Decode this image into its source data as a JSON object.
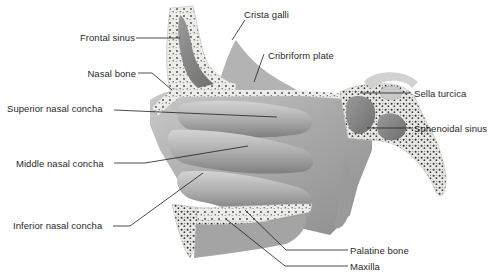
{
  "figure": {
    "colors": {
      "background": "#ffffff",
      "bone_cortex": "#e9e9e6",
      "bone_spongy_dots": "#3a3a3a",
      "soft_tissue_light": "#bdbdbd",
      "soft_tissue_mid": "#9c9c9c",
      "soft_tissue_dark": "#7a7a7a",
      "sinus_cavity": "#8a8a8a",
      "leader_line": "#1e1e1e",
      "label_text": "#2a2a2a"
    },
    "labels": [
      {
        "id": "frontal-sinus",
        "text": "Frontal sinus",
        "side": "left"
      },
      {
        "id": "crista-galli",
        "text": "Crista galli",
        "side": "top"
      },
      {
        "id": "cribriform-plate",
        "text": "Cribriform plate",
        "side": "top"
      },
      {
        "id": "nasal-bone",
        "text": "Nasal bone",
        "side": "left"
      },
      {
        "id": "superior-nasal-concha",
        "text": "Superior nasal concha",
        "side": "left"
      },
      {
        "id": "sella-turcica",
        "text": "Sella turcica",
        "side": "right"
      },
      {
        "id": "sphenoidal-sinus",
        "text": "Sphenoidal sinus",
        "side": "right"
      },
      {
        "id": "middle-nasal-concha",
        "text": "Middle nasal concha",
        "side": "left"
      },
      {
        "id": "inferior-nasal-concha",
        "text": "Inferior nasal concha",
        "side": "left"
      },
      {
        "id": "palatine-bone",
        "text": "Palatine bone",
        "side": "right"
      },
      {
        "id": "maxilla",
        "text": "Maxilla",
        "side": "right"
      }
    ]
  }
}
